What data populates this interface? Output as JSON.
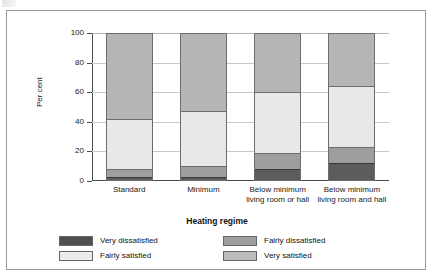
{
  "chart_data": {
    "type": "bar",
    "stacked": true,
    "title": "",
    "xlabel": "Heating regime",
    "ylabel": "Per cent",
    "ylim": [
      0,
      100
    ],
    "yticks": [
      0,
      20,
      40,
      60,
      80,
      100
    ],
    "grid": true,
    "legend_position": "bottom",
    "categories": [
      "Standard",
      "Minimum",
      "Below minimum living room or hall",
      "Below minimum living room and hall"
    ],
    "category_lines": [
      [
        "Standard"
      ],
      [
        "Minimum"
      ],
      [
        "Below minimum",
        "living room or hall"
      ],
      [
        "Below minimum",
        "living room and hall"
      ]
    ],
    "series": [
      {
        "name": "Very dissatisfied",
        "color": "#5c5c5c",
        "values": [
          3,
          3,
          8,
          12
        ]
      },
      {
        "name": "Fairly dissatisfied",
        "color": "#9e9e9e",
        "values": [
          5,
          7,
          11,
          11
        ]
      },
      {
        "name": "Fairly satisfied",
        "color": "#e8e8e8",
        "values": [
          34,
          37,
          41,
          41
        ]
      },
      {
        "name": "Very satisfied",
        "color": "#b5b5b5",
        "values": [
          58,
          53,
          40,
          36
        ]
      }
    ],
    "cumulative_boundaries": [
      [
        3,
        8,
        42,
        100
      ],
      [
        3,
        10,
        47,
        100
      ],
      [
        8,
        19,
        60,
        100
      ],
      [
        12,
        23,
        64,
        100
      ]
    ]
  },
  "axis": {
    "y_title": "Per cent",
    "x_title": "Heating regime",
    "tick_labels": [
      "100",
      "80",
      "60",
      "40",
      "20",
      "0"
    ]
  },
  "legend": {
    "items": [
      {
        "label": "Very dissatisfied",
        "swatch": "very-dissatisfied"
      },
      {
        "label": "Fairly dissatisfied",
        "swatch": "fairly-dissatisfied"
      },
      {
        "label": "Fairly satisfied",
        "swatch": "fairly-satisfied"
      },
      {
        "label": "Very satisfied",
        "swatch": "very-satisfied"
      }
    ]
  }
}
